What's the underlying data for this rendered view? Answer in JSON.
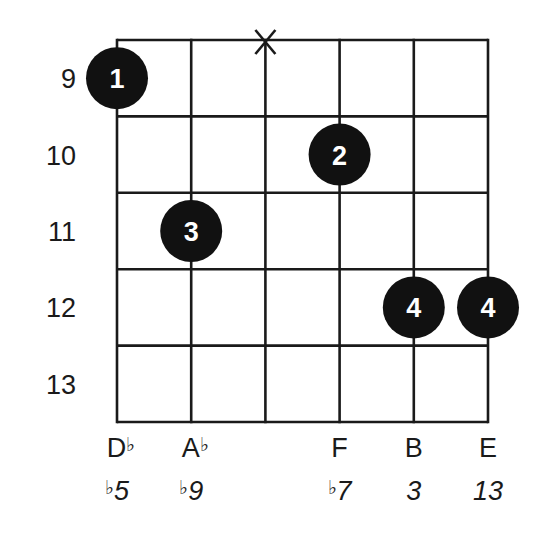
{
  "chart_data": {
    "type": "chord-diagram",
    "instrument": "guitar",
    "strings": 6,
    "start_fret": 9,
    "fret_labels": [
      "9",
      "10",
      "11",
      "12",
      "13"
    ],
    "muted_strings": [
      3
    ],
    "fingers": [
      {
        "string": 1,
        "fret": 9,
        "finger": "1"
      },
      {
        "string": 2,
        "fret": 11,
        "finger": "3"
      },
      {
        "string": 4,
        "fret": 10,
        "finger": "2"
      },
      {
        "string": 5,
        "fret": 12,
        "finger": "4"
      },
      {
        "string": 6,
        "fret": 12,
        "finger": "4"
      }
    ],
    "notes": [
      {
        "string": 1,
        "note": "D",
        "accidental": "♭",
        "interval_prefix": "♭",
        "interval": "5"
      },
      {
        "string": 2,
        "note": "A",
        "accidental": "♭",
        "interval_prefix": "♭",
        "interval": "9"
      },
      {
        "string": 3,
        "note": "",
        "accidental": "",
        "interval_prefix": "",
        "interval": ""
      },
      {
        "string": 4,
        "note": "F",
        "accidental": "",
        "interval_prefix": "♭",
        "interval": "7"
      },
      {
        "string": 5,
        "note": "B",
        "accidental": "",
        "interval_prefix": "",
        "interval": "3"
      },
      {
        "string": 6,
        "note": "E",
        "accidental": "",
        "interval_prefix": "",
        "interval": "13"
      }
    ]
  },
  "colors": {
    "line": "#1a1a1a",
    "dot": "#111111",
    "dot_text": "#ffffff",
    "background": "#ffffff"
  },
  "labels": {
    "muted_symbol": "X"
  }
}
